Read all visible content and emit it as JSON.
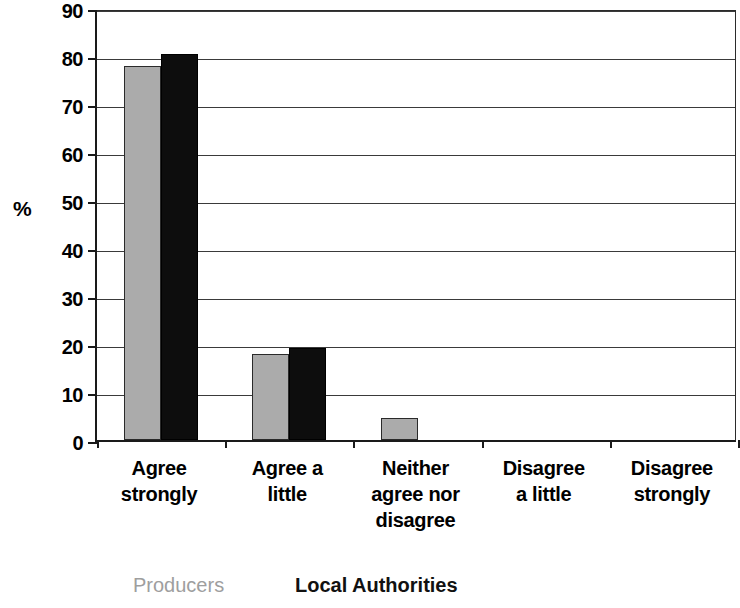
{
  "chart_data": {
    "type": "bar",
    "title": "",
    "xlabel": "",
    "ylabel": "%",
    "ylim": [
      0,
      90
    ],
    "ytick_step": 10,
    "yticks": [
      90,
      80,
      70,
      60,
      50,
      40,
      30,
      20,
      10,
      0
    ],
    "grid": true,
    "legend_position": "bottom",
    "categories": [
      "Agree strongly",
      "Agree a little",
      "Neither agree nor disagree",
      "Disagree a little",
      "Disagree strongly"
    ],
    "category_lines": [
      [
        "Agree",
        "strongly"
      ],
      [
        "Agree a",
        "little"
      ],
      [
        "Neither",
        "agree nor",
        "disagree"
      ],
      [
        "Disagree",
        "a little"
      ],
      [
        "Disagree",
        "strongly"
      ]
    ],
    "series": [
      {
        "name": "Producers",
        "color": "#ababab",
        "values": [
          78,
          18,
          4.5,
          0,
          0
        ]
      },
      {
        "name": "Local Authorities",
        "color": "#0d0d0d",
        "values": [
          80.5,
          19.2,
          0,
          0,
          0
        ]
      }
    ]
  },
  "axis": {
    "y_title": "%"
  },
  "legend": {
    "producers_label": "Producers",
    "authorities_label": "Local Authorities"
  }
}
